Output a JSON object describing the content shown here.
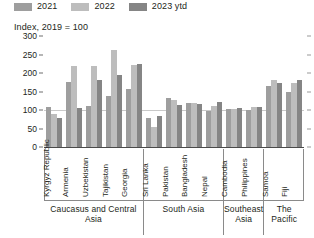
{
  "subtitle": "Index, 2019 = 100",
  "legend": {
    "position": "top-left",
    "items": [
      {
        "label": "2021",
        "color": "#9e9e9e",
        "swatch_name": "legend-swatch-2021"
      },
      {
        "label": "2022",
        "color": "#bdbdbd",
        "swatch_name": "legend-swatch-2022"
      },
      {
        "label": "2023 ytd",
        "color": "#858585",
        "swatch_name": "legend-swatch-2023-ytd"
      }
    ]
  },
  "yaxis": {
    "ticks": [
      "300",
      "250",
      "200",
      "150",
      "100",
      "50",
      "0"
    ]
  },
  "regions": [
    {
      "label": "Caucasus and Central  Asia",
      "count": 5
    },
    {
      "label": "South Asia",
      "count": 4
    },
    {
      "label": "Southeast Asia",
      "count": 2
    },
    {
      "label": "The Pacific",
      "count": 2
    }
  ],
  "chart_data": {
    "type": "bar",
    "title": "",
    "subtitle": "Index, 2019 = 100",
    "xlabel": "",
    "ylabel": "",
    "ylim": [
      0,
      300
    ],
    "yticks": [
      0,
      50,
      100,
      150,
      200,
      250,
      300
    ],
    "grid": false,
    "reference_line": 100,
    "legend_position": "top-left",
    "categories": [
      "Kyrgyz Republic",
      "Armenia",
      "Uzbekistan",
      "Tajikistan",
      "Georgia",
      "Sri Lanka",
      "Pakistan",
      "Bangladesh",
      "Nepal",
      "Cambodia",
      "Philippines",
      "Samoa",
      "Fiji"
    ],
    "category_groups": [
      {
        "region": "Caucasus and Central  Asia",
        "categories": [
          "Kyrgyz Republic",
          "Armenia",
          "Uzbekistan",
          "Tajikistan",
          "Georgia"
        ]
      },
      {
        "region": "South Asia",
        "categories": [
          "Sri Lanka",
          "Pakistan",
          "Bangladesh",
          "Nepal"
        ]
      },
      {
        "region": "Southeast Asia",
        "categories": [
          "Cambodia",
          "Philippines"
        ]
      },
      {
        "region": "The Pacific",
        "categories": [
          "Samoa",
          "Fiji"
        ]
      }
    ],
    "series": [
      {
        "name": "2021",
        "color": "#9e9e9e",
        "values": [
          108,
          175,
          110,
          137,
          157,
          78,
          133,
          118,
          98,
          102,
          99,
          165,
          148
        ]
      },
      {
        "name": "2022",
        "color": "#bdbdbd",
        "values": [
          90,
          220,
          218,
          263,
          222,
          53,
          128,
          120,
          110,
          102,
          107,
          180,
          172
        ]
      },
      {
        "name": "2023 ytd",
        "color": "#858585",
        "values": [
          78,
          105,
          182,
          195,
          224,
          83,
          113,
          115,
          122,
          105,
          107,
          172,
          180
        ]
      }
    ]
  }
}
